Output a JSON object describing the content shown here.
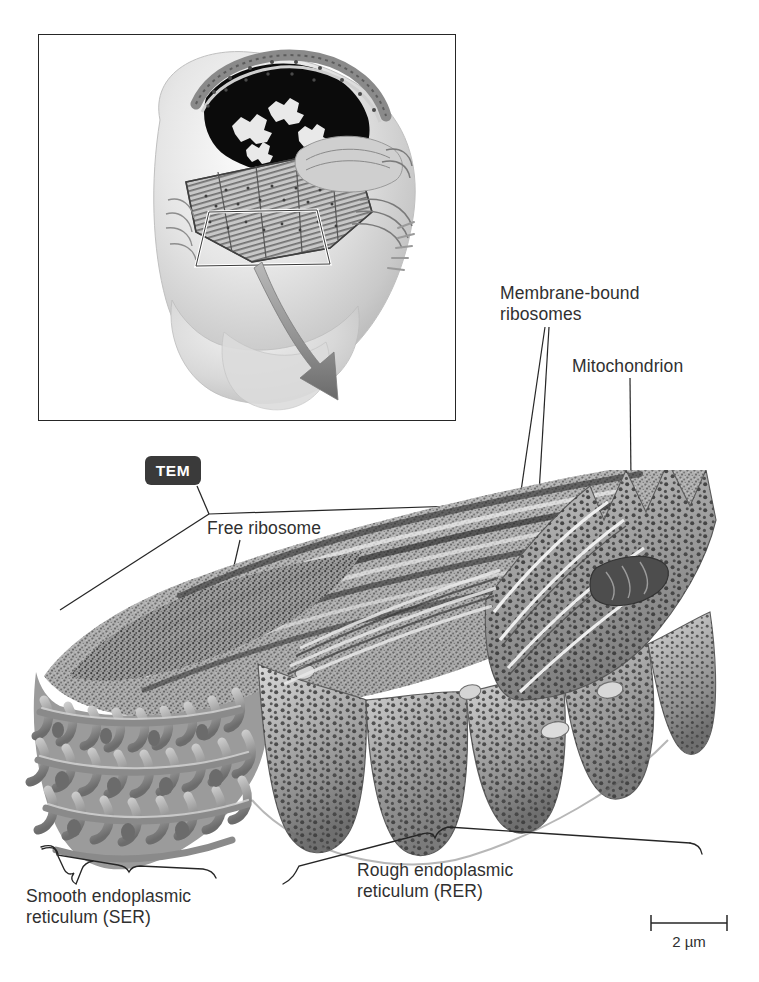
{
  "figure": {
    "background_color": "#ffffff",
    "text_color": "#303030",
    "line_color": "#262626",
    "badge_color": "#3a3a3a",
    "badge_text_color": "#ffffff"
  },
  "inset": {
    "name": "cell-overview-illustration",
    "description": "Cutaway drawing of a whole cell showing nucleus, endoplasmic reticulum and organelles",
    "highlight_box": "trapezoid outline marking the magnified region",
    "arrow": "tapered gray arrow pointing down to the TEM micrograph"
  },
  "badge": {
    "label": "TEM"
  },
  "labels": {
    "membrane_bound_ribosomes": "Membrane-bound\nribosomes",
    "mitochondrion": "Mitochondrion",
    "free_ribosome": "Free ribosome",
    "smooth_er": "Smooth endoplasmic\nreticulum (SER)",
    "rough_er": "Rough endoplasmic\nreticulum (RER)"
  },
  "scale_bar": {
    "label": "2 µm",
    "length_px": 76,
    "value": 2,
    "unit": "µm"
  },
  "micrograph": {
    "name": "er-tem-micrograph",
    "regions": [
      {
        "name": "smooth-er-region",
        "label": "Smooth endoplasmic reticulum (SER)",
        "texture": "tubular network of interconnected loops"
      },
      {
        "name": "rough-er-region",
        "label": "Rough endoplasmic reticulum (RER)",
        "texture": "flattened cisternae studded with ribosome dots"
      }
    ],
    "features": [
      {
        "name": "free-ribosome",
        "label": "Free ribosome"
      },
      {
        "name": "membrane-bound-ribosomes",
        "label": "Membrane-bound ribosomes"
      },
      {
        "name": "mitochondrion",
        "label": "Mitochondrion"
      }
    ]
  }
}
